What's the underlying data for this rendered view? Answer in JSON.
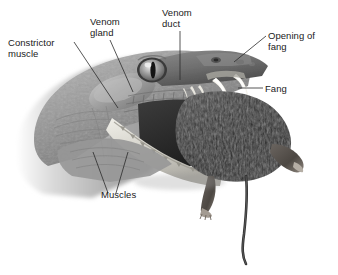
{
  "figure": {
    "background_color": "#ffffff",
    "label_color": "#1a1a1a",
    "leader_color": "#2b2b2b",
    "width": 338,
    "height": 275
  },
  "labels": [
    {
      "id": "constrictor-muscle",
      "line1": "Constrictor",
      "line2": "muscle",
      "text": "Constrictor muscle"
    },
    {
      "id": "venom-gland",
      "line1": "Venom",
      "line2": "gland",
      "text": "Venom gland"
    },
    {
      "id": "venom-duct",
      "line1": "Venom",
      "line2": "duct",
      "text": "Venom duct"
    },
    {
      "id": "opening-of-fang",
      "line1": "Opening of",
      "line2": "fang",
      "text": "Opening of fang"
    },
    {
      "id": "fang",
      "line1": "Fang",
      "line2": "",
      "text": "Fang"
    },
    {
      "id": "muscles",
      "line1": "Muscles",
      "line2": "",
      "text": "Muscles"
    }
  ],
  "artwork": {
    "snake_head": "grayscale scaled snake head in left profile, mouth open",
    "snake_eye": "round eye with vertical slit pupil",
    "fangs": "two pale curved upper fangs plus small replacement teeth",
    "lower_jaw": "long pale toothed lower jaw angled down-right",
    "prey": "dark furred mouse held in the jaws",
    "prey_tail": "long thin tail curving down to lower right",
    "prey_limbs": "two hind limbs with visible foot and toes"
  }
}
